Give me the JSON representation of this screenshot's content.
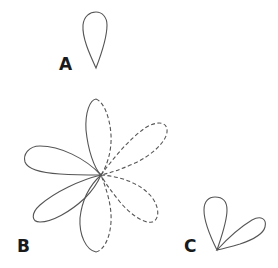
{
  "figures": [
    {
      "label": "A",
      "lobes": 1
    },
    {
      "label": "B",
      "lobes_solid": 3,
      "lobes_dashed": 3
    },
    {
      "label": "C",
      "lobes": 2
    }
  ],
  "colors": {
    "stroke": "#555555",
    "label": "#1a1a1a"
  }
}
